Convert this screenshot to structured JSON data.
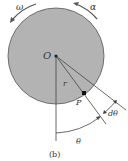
{
  "diagram": {
    "caption": "(b)",
    "labels": {
      "omega": "ω",
      "alpha": "α",
      "center": "O",
      "radius": "r",
      "point": "P",
      "angle": "θ",
      "dangle": "dθ"
    },
    "colors": {
      "disk_fill": "#b3b3b3",
      "disk_stroke": "#555555",
      "line": "#444444",
      "text": "#333333"
    }
  }
}
